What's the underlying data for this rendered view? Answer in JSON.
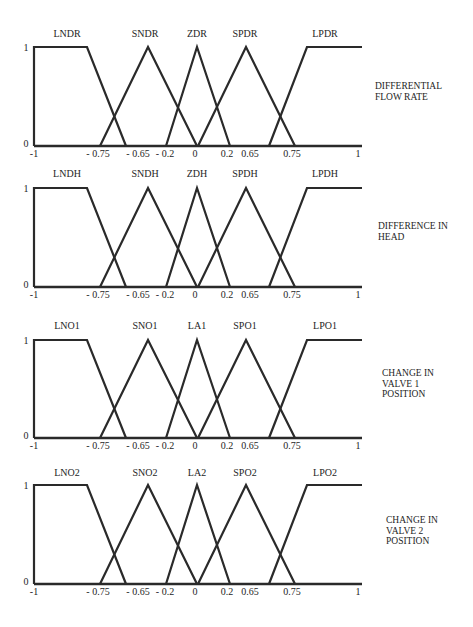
{
  "chart_data": [
    {
      "type": "line",
      "title": "DIFFERENTIAL FLOW RATE",
      "title_lines": [
        "DIFFERENTIAL",
        "FLOW RATE"
      ],
      "ylabel_ticks": [
        "0",
        "1"
      ],
      "ylim": [
        0,
        1
      ],
      "x_tick_labels": [
        "-1",
        "- 0.75",
        "- 0.65",
        "- 0.2",
        "0",
        "0.2",
        "0.65",
        "0.75",
        "1"
      ],
      "grid": false,
      "series": [
        {
          "name": "LNDR",
          "shape": "trapezoid-left"
        },
        {
          "name": "SNDR",
          "shape": "triangle"
        },
        {
          "name": "ZDR",
          "shape": "triangle"
        },
        {
          "name": "SPDR",
          "shape": "triangle"
        },
        {
          "name": "LPDR",
          "shape": "trapezoid-right"
        }
      ]
    },
    {
      "type": "line",
      "title": "DIFFERENCE IN HEAD",
      "title_lines": [
        "DIFFERENCE IN",
        "HEAD"
      ],
      "ylabel_ticks": [
        "0",
        "1"
      ],
      "ylim": [
        0,
        1
      ],
      "x_tick_labels": [
        "-1",
        "- 0.75",
        "- 0.65",
        "- 0.2",
        "0",
        "0.2",
        "0.65",
        "0.75",
        "1"
      ],
      "grid": false,
      "series": [
        {
          "name": "LNDH",
          "shape": "trapezoid-left"
        },
        {
          "name": "SNDH",
          "shape": "triangle"
        },
        {
          "name": "ZDH",
          "shape": "triangle"
        },
        {
          "name": "SPDH",
          "shape": "triangle"
        },
        {
          "name": "LPDH",
          "shape": "trapezoid-right"
        }
      ]
    },
    {
      "type": "line",
      "title": "CHANGE IN VALVE 1 POSITION",
      "title_lines": [
        "CHANGE IN",
        "VALVE 1",
        "POSITION"
      ],
      "ylabel_ticks": [
        "0",
        "1"
      ],
      "ylim": [
        0,
        1
      ],
      "x_tick_labels": [
        "-1",
        "- 0.75",
        "- 0.65",
        "- 0.2",
        "0",
        "0.2",
        "0.65",
        "0.75",
        "1"
      ],
      "grid": false,
      "series": [
        {
          "name": "LNO1",
          "shape": "trapezoid-left"
        },
        {
          "name": "SNO1",
          "shape": "triangle"
        },
        {
          "name": "LA1",
          "shape": "triangle"
        },
        {
          "name": "SPO1",
          "shape": "triangle"
        },
        {
          "name": "LPO1",
          "shape": "trapezoid-right"
        }
      ]
    },
    {
      "type": "line",
      "title": "CHANGE IN VALVE 2 POSITION",
      "title_lines": [
        "CHANGE IN",
        "VALVE 2",
        "POSITION"
      ],
      "ylabel_ticks": [
        "0",
        "1"
      ],
      "ylim": [
        0,
        1
      ],
      "x_tick_labels": [
        "-1",
        "- 0.75",
        "- 0.65",
        "- 0.2",
        "0",
        "0.2",
        "0.65",
        "0.75",
        "1"
      ],
      "grid": false,
      "series": [
        {
          "name": "LNO2",
          "shape": "trapezoid-left"
        },
        {
          "name": "SNO2",
          "shape": "triangle"
        },
        {
          "name": "LA2",
          "shape": "triangle"
        },
        {
          "name": "SPO2",
          "shape": "triangle"
        },
        {
          "name": "LPO2",
          "shape": "trapezoid-right"
        }
      ]
    }
  ],
  "geometry": {
    "x_left": 34,
    "x_right": 362,
    "mf_x": {
      "lnd": [
        34,
        87,
        126
      ],
      "snd": [
        100,
        148,
        197
      ],
      "z": [
        166,
        197,
        230
      ],
      "spd": [
        198,
        246,
        295
      ],
      "lpd": [
        269,
        307,
        362
      ]
    },
    "series_label_x": [
      67,
      145,
      197,
      245,
      325
    ],
    "tick_label_x": [
      34,
      98,
      138,
      165,
      195,
      227,
      250,
      292,
      358
    ],
    "panels": [
      {
        "label_y": 37,
        "top": 47,
        "base": 146,
        "tick_y": 157,
        "var_x": 375,
        "var_y": 89
      },
      {
        "label_y": 177,
        "top": 188,
        "base": 287,
        "tick_y": 298,
        "var_x": 378,
        "var_y": 229
      },
      {
        "label_y": 329,
        "top": 340,
        "base": 438,
        "tick_y": 449,
        "var_x": 382,
        "var_y": 376
      },
      {
        "label_y": 476,
        "top": 485,
        "base": 584,
        "tick_y": 595,
        "var_x": 386,
        "var_y": 523
      }
    ]
  }
}
